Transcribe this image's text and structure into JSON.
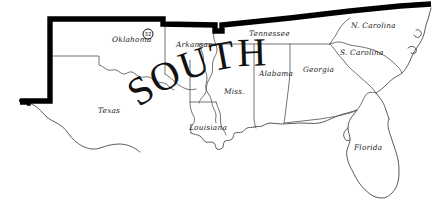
{
  "map": {
    "title": "SOUTH",
    "region_label": "SOUTH",
    "background_color": "#ffffff",
    "outline_color": "#5a5a5a",
    "region_border_color": "#000000",
    "label_color": "#1c1c1c",
    "states": [
      {
        "id": "texas",
        "label": "Texas",
        "x": 98,
        "y": 113
      },
      {
        "id": "oklahoma",
        "label": "Oklahoma",
        "x": 133,
        "y": 42
      },
      {
        "id": "arkansas",
        "label": "Arkansas",
        "x": 179,
        "y": 47
      },
      {
        "id": "louisiana",
        "label": "Louisiana",
        "x": 192,
        "y": 130
      },
      {
        "id": "mississippi",
        "label": "Miss.",
        "x": 228,
        "y": 94
      },
      {
        "id": "alabama",
        "label": "Alabama",
        "x": 266,
        "y": 76
      },
      {
        "id": "tennessee",
        "label": "Tennessee",
        "x": 257,
        "y": 36
      },
      {
        "id": "georgia",
        "label": "Georgia",
        "x": 313,
        "y": 72
      },
      {
        "id": "florida",
        "label": "Florida",
        "x": 358,
        "y": 150
      },
      {
        "id": "south-carolina",
        "label": "S. Carolina",
        "x": 352,
        "y": 55
      },
      {
        "id": "north-carolina",
        "label": "N. Carolina",
        "x": 363,
        "y": 28
      }
    ],
    "markers": [
      {
        "id": "marker-32",
        "value": "32",
        "x": 148,
        "y": 34,
        "radius": 5
      }
    ]
  }
}
